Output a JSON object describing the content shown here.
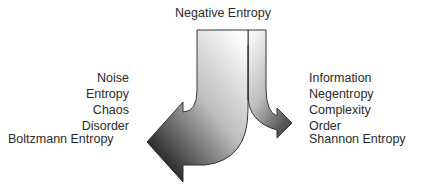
{
  "diagram": {
    "top_label": "Negative Entropy",
    "left_terms": [
      "Noise",
      "Entropy",
      "Chaos",
      "Disorder"
    ],
    "left_bottom_label": "Boltzmann Entropy",
    "right_terms": [
      "Information",
      "Negentropy",
      "Complexity",
      "Order"
    ],
    "right_bottom_label": "Shannon Entropy",
    "arrows": {
      "left": "large curved arrow pointing down-left",
      "right": "small curved arrow pointing right"
    },
    "colors": {
      "arrow_light": "#ffffff",
      "arrow_dark": "#111111",
      "outline": "#222222",
      "text": "#2a2a2a"
    }
  }
}
